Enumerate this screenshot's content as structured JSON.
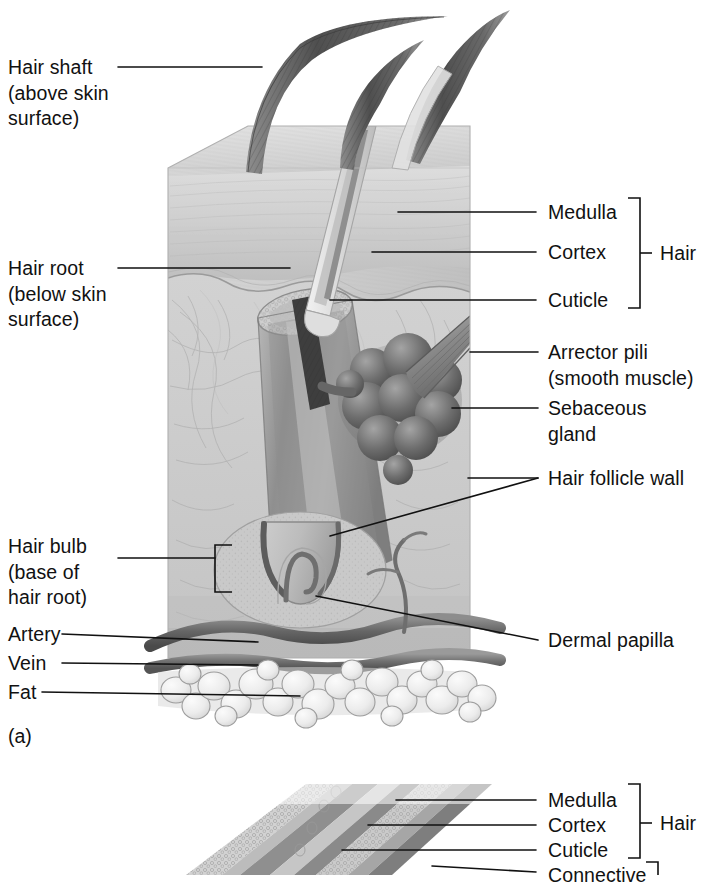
{
  "figure": {
    "type": "anatomical-illustration",
    "style": "grayscale textbook line-and-tone drawing",
    "panels": [
      {
        "id": "a",
        "caption": "(a)",
        "description": "Three-dimensional block of skin showing hair shafts, follicle, glands, vessels and fat"
      },
      {
        "id": "b",
        "caption": "",
        "description": "Magnified longitudinal section of hair and follicle wall (partially cropped at bottom of image)"
      }
    ]
  },
  "labels_left": [
    {
      "name": "hair-shaft",
      "lines": [
        "Hair shaft",
        "(above skin",
        "surface)"
      ]
    },
    {
      "name": "hair-root",
      "lines": [
        "Hair root",
        "(below skin",
        "surface)"
      ]
    },
    {
      "name": "hair-bulb",
      "lines": [
        "Hair bulb",
        "(base of",
        "hair root)"
      ]
    },
    {
      "name": "artery",
      "lines": [
        "Artery"
      ]
    },
    {
      "name": "vein",
      "lines": [
        "Vein"
      ]
    },
    {
      "name": "fat",
      "lines": [
        "Fat"
      ]
    }
  ],
  "labels_right": [
    {
      "name": "medulla",
      "lines": [
        "Medulla"
      ]
    },
    {
      "name": "cortex",
      "lines": [
        "Cortex"
      ]
    },
    {
      "name": "cuticle",
      "lines": [
        "Cuticle"
      ]
    },
    {
      "name": "arrector-pili",
      "lines": [
        "Arrector pili",
        "(smooth muscle)"
      ]
    },
    {
      "name": "sebaceous-gland",
      "lines": [
        "Sebaceous",
        "gland"
      ]
    },
    {
      "name": "hair-follicle-wall",
      "lines": [
        "Hair follicle wall"
      ]
    },
    {
      "name": "dermal-papilla",
      "lines": [
        "Dermal papilla"
      ]
    }
  ],
  "brackets": [
    {
      "name": "hair-bracket-panel-a",
      "label": "Hair",
      "groups": [
        "Medulla",
        "Cortex",
        "Cuticle"
      ]
    },
    {
      "name": "hair-bracket-panel-b",
      "label": "Hair",
      "groups": [
        "Medulla",
        "Cortex",
        "Cuticle"
      ]
    },
    {
      "name": "connective-bracket-panel-b",
      "label": "Connective",
      "groups": []
    }
  ],
  "panel_b_labels": [
    {
      "name": "medulla",
      "lines": [
        "Medulla"
      ]
    },
    {
      "name": "cortex",
      "lines": [
        "Cortex"
      ]
    },
    {
      "name": "cuticle",
      "lines": [
        "Cuticle"
      ]
    },
    {
      "name": "connective",
      "lines": [
        "Connective"
      ]
    }
  ],
  "panel_b_bracket_label": "Hair",
  "panel_a_caption": "(a)",
  "colors": {
    "ink": "#111111",
    "background": "#ffffff",
    "skin_light": "#d9d9d9",
    "skin_mid": "#c2c2c2",
    "skin_dark": "#a8a8a8",
    "epidermis": "#cfcfcf",
    "follicle": "#9a9a9a",
    "gland_dark": "#6e6e6e",
    "hair_dark": "#5a5a5a",
    "vessel_dark": "#6b6b6b",
    "fat_light": "#ededed"
  }
}
